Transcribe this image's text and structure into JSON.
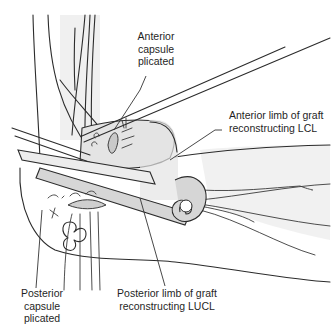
{
  "figure": {
    "labels": {
      "anterior_capsule": "Anterior\ncapsule\nplicated",
      "anterior_limb": "Anterior limb of graft\nreconstructing LCL",
      "posterior_capsule": "Posterior\ncapsule\nplicated",
      "posterior_limb": "Posterior limb of graft\nreconstructing LUCL"
    }
  }
}
